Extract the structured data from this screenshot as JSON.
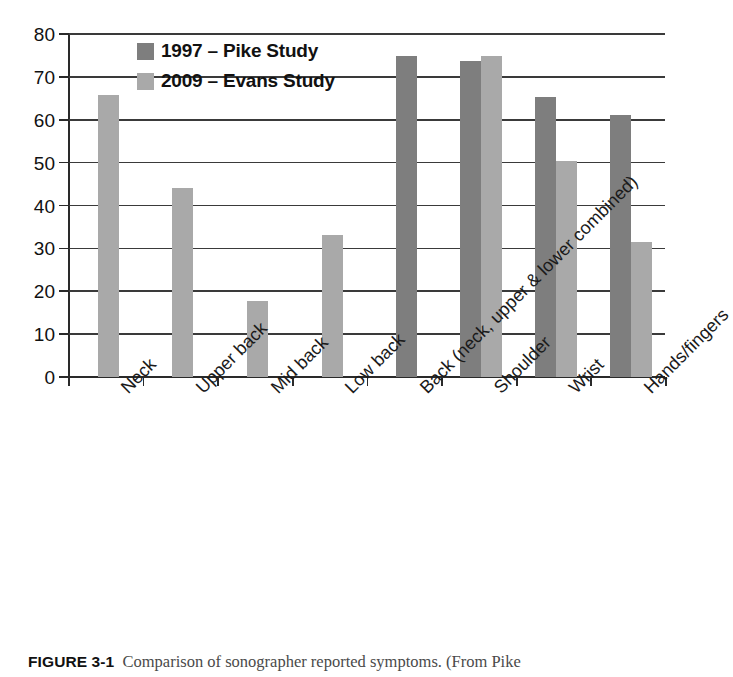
{
  "chart_data": {
    "type": "bar",
    "title": "",
    "xlabel": "",
    "ylabel": "",
    "ylim": [
      0,
      80
    ],
    "ytick_step": 10,
    "yticks": [
      "80",
      "70",
      "60",
      "50",
      "40",
      "30",
      "20",
      "10",
      "0"
    ],
    "grid": true,
    "legend_position": "top-left-inside",
    "categories": [
      "Neck",
      "Upper back",
      "Mid back",
      "Low back",
      "Back (neck, upper & lower combined)",
      "Shoulder",
      "Wrist",
      "Hands/fingers"
    ],
    "series": [
      {
        "name": "1997 – Pike Study",
        "color": "#7e7e7e",
        "values": [
          null,
          null,
          null,
          null,
          74.8,
          73.8,
          65.2,
          61.0
        ]
      },
      {
        "name": "2009 – Evans Study",
        "color": "#a9a9a9",
        "values": [
          65.8,
          44.0,
          17.8,
          33.2,
          null,
          74.8,
          50.3,
          31.6
        ]
      }
    ]
  },
  "legend": {
    "items": [
      {
        "label": "1997 – Pike Study",
        "swatch": "dark"
      },
      {
        "label": "2009 – Evans Study",
        "swatch": "light"
      }
    ]
  },
  "caption": {
    "figure_number": "FIGURE 3-1",
    "text": "Comparison of sonographer reported symptoms. (From Pike"
  }
}
